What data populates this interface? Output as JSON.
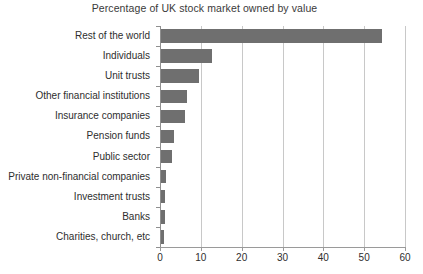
{
  "chart_data": {
    "type": "bar",
    "orientation": "horizontal",
    "title": "Percentage of UK stock market owned by value",
    "xlabel": "",
    "ylabel": "",
    "xlim": [
      0,
      60
    ],
    "xticks": [
      0,
      10,
      20,
      30,
      40,
      50,
      60
    ],
    "xtick_labels": [
      "0",
      "10",
      "20",
      "30",
      "40",
      "50",
      "60"
    ],
    "grid": "vertical",
    "legend": "none",
    "bar_color": "#6f6f6f",
    "grid_color": "#c8c8c8",
    "axis_color": "#9a9a9a",
    "categories": [
      "Rest of the world",
      "Individuals",
      "Unit trusts",
      "Other financial institutions",
      "Insurance companies",
      "Pension funds",
      "Public sector",
      "Private non-financial companies",
      "Investment trusts",
      "Banks",
      "Charities, church, etc"
    ],
    "values": [
      54.2,
      12.5,
      9.3,
      6.4,
      5.9,
      3.2,
      2.7,
      1.3,
      1.1,
      1.0,
      0.7
    ]
  }
}
